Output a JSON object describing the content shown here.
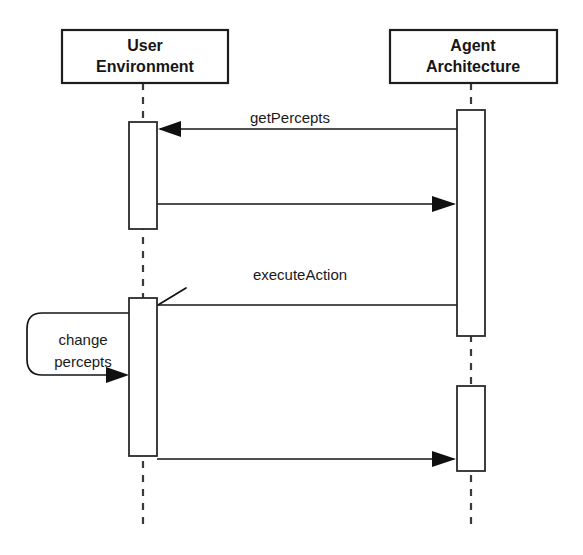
{
  "diagram": {
    "kind": "uml-sequence-diagram",
    "background_color": "#ffffff",
    "line_color": "#151515",
    "text_color": "#1a1a1a",
    "participants": [
      {
        "id": "user-environment",
        "label_line1": "User",
        "label_line2": "Environment",
        "box": {
          "x": 62,
          "y": 30,
          "width": 166,
          "height": 53
        },
        "lifeline_x": 143,
        "lifeline_bottom": 531
      },
      {
        "id": "agent-architecture",
        "label_line1": "Agent",
        "label_line2": "Architecture",
        "box": {
          "x": 390,
          "y": 30,
          "width": 167,
          "height": 53
        },
        "lifeline_x": 471,
        "lifeline_bottom": 529
      }
    ],
    "activations": [
      {
        "id": "user-activation-1",
        "participant": "user-environment",
        "x": 129,
        "y": 122,
        "width": 28,
        "height": 107
      },
      {
        "id": "user-activation-2",
        "participant": "user-environment",
        "x": 129,
        "y": 298,
        "width": 28,
        "height": 158
      },
      {
        "id": "agent-activation-1",
        "participant": "agent-architecture",
        "x": 457,
        "y": 110,
        "width": 28,
        "height": 226
      },
      {
        "id": "agent-activation-2",
        "participant": "agent-architecture",
        "x": 457,
        "y": 386,
        "width": 28,
        "height": 85
      }
    ],
    "messages": [
      {
        "id": "get-percepts",
        "label": "getPercepts",
        "direction": "right-to-left",
        "arrowhead": "filled",
        "from_x": 457,
        "to_x": 158,
        "y": 129,
        "label_x": 290,
        "label_y": 123
      },
      {
        "id": "percepts-return",
        "label": "",
        "direction": "left-to-right",
        "arrowhead": "filled",
        "from_x": 157,
        "to_x": 456,
        "y": 204,
        "label_x": 300,
        "label_y": 198
      },
      {
        "id": "execute-action",
        "label": "executeAction",
        "direction": "right-to-left",
        "arrowhead": "open",
        "from_x": 457,
        "to_x": 158,
        "y": 305,
        "label_x": 300,
        "label_y": 280
      },
      {
        "id": "action-result",
        "label": "",
        "direction": "left-to-right",
        "arrowhead": "filled",
        "from_x": 157,
        "to_x": 456,
        "y": 459,
        "label_x": 300,
        "label_y": 453
      }
    ],
    "self_messages": [
      {
        "id": "change-percepts",
        "label_line1": "change",
        "label_line2": "percepts",
        "participant": "user-environment",
        "arrowhead": "filled",
        "start_x": 129,
        "start_y": 313,
        "loop_left_x": 27,
        "end_x": 128,
        "end_y": 375,
        "label_x": 83,
        "label_y": 345
      }
    ]
  }
}
